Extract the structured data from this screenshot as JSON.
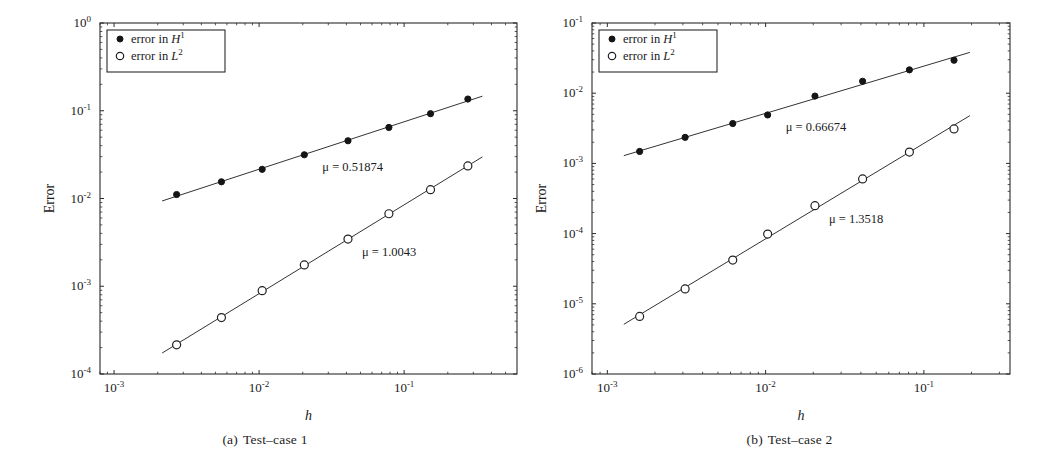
{
  "figure": {
    "panels": [
      {
        "id": "a",
        "caption_tag": "(a)",
        "caption_text": "Test–case 1",
        "xlabel": "h",
        "ylabel": "Error",
        "legend": [
          {
            "marker": "filled-dot",
            "label": "error in ",
            "math_base": "H",
            "math_exp": "1"
          },
          {
            "marker": "open-circle",
            "label": "error in ",
            "math_base": "L",
            "math_exp": "2"
          }
        ],
        "annotations": [
          {
            "name": "slope-h1",
            "text": "μ = 0.51874",
            "mu": 0.51874
          },
          {
            "name": "slope-l2",
            "text": "μ = 1.0043",
            "mu": 1.0043
          }
        ],
        "xticks": [
          {
            "base": "10",
            "exp": "-3",
            "value": 0.001
          },
          {
            "base": "10",
            "exp": "-2",
            "value": 0.01
          },
          {
            "base": "10",
            "exp": "-1",
            "value": 0.1
          }
        ],
        "yticks": [
          {
            "base": "10",
            "exp": "-4",
            "value": 0.0001
          },
          {
            "base": "10",
            "exp": "-3",
            "value": 0.001
          },
          {
            "base": "10",
            "exp": "-2",
            "value": 0.01
          },
          {
            "base": "10",
            "exp": "-1",
            "value": 0.1
          },
          {
            "base": "10",
            "exp": "0",
            "value": 1
          }
        ]
      },
      {
        "id": "b",
        "caption_tag": "(b)",
        "caption_text": "Test–case 2",
        "xlabel": "h",
        "ylabel": "Error",
        "legend": [
          {
            "marker": "filled-dot",
            "label": "error in ",
            "math_base": "H",
            "math_exp": "1"
          },
          {
            "marker": "open-circle",
            "label": "error in ",
            "math_base": "L",
            "math_exp": "2"
          }
        ],
        "annotations": [
          {
            "name": "slope-h1",
            "text": "μ = 0.66674",
            "mu": 0.66674
          },
          {
            "name": "slope-l2",
            "text": "μ = 1.3518",
            "mu": 1.3518
          }
        ],
        "xticks": [
          {
            "base": "10",
            "exp": "-3",
            "value": 0.001
          },
          {
            "base": "10",
            "exp": "-2",
            "value": 0.01
          },
          {
            "base": "10",
            "exp": "-1",
            "value": 0.1
          }
        ],
        "yticks": [
          {
            "base": "10",
            "exp": "-6",
            "value": 1e-06
          },
          {
            "base": "10",
            "exp": "-5",
            "value": 1e-05
          },
          {
            "base": "10",
            "exp": "-4",
            "value": 0.0001
          },
          {
            "base": "10",
            "exp": "-3",
            "value": 0.001
          },
          {
            "base": "10",
            "exp": "-2",
            "value": 0.01
          },
          {
            "base": "10",
            "exp": "-1",
            "value": 0.1
          }
        ]
      }
    ]
  },
  "chart_data": [
    {
      "type": "line",
      "panel": "a",
      "title": "(a) Test–case 1",
      "xlabel": "h",
      "ylabel": "Error",
      "xscale": "log",
      "yscale": "log",
      "xlim": [
        0.0008,
        0.6
      ],
      "ylim": [
        0.0001,
        1.0
      ],
      "grid": false,
      "legend_position": "top-left",
      "series": [
        {
          "name": "error in H^1",
          "marker": "filled-dot",
          "slope_label": "μ = 0.51874",
          "slope": 0.51874,
          "x": [
            0.0027,
            0.0055,
            0.0105,
            0.0205,
            0.041,
            0.0785,
            0.152,
            0.275
          ],
          "y": [
            0.0111,
            0.0155,
            0.0215,
            0.0315,
            0.0455,
            0.0645,
            0.0925,
            0.136
          ]
        },
        {
          "name": "error in L^2",
          "marker": "open-circle",
          "slope_label": "μ = 1.0043",
          "slope": 1.0043,
          "x": [
            0.0027,
            0.0055,
            0.0105,
            0.0205,
            0.041,
            0.0785,
            0.152,
            0.275
          ],
          "y": [
            0.000215,
            0.00044,
            0.00089,
            0.00175,
            0.00345,
            0.0067,
            0.0126,
            0.0235
          ]
        }
      ]
    },
    {
      "type": "line",
      "panel": "b",
      "title": "(b) Test–case 2",
      "xlabel": "h",
      "ylabel": "Error",
      "xscale": "log",
      "yscale": "log",
      "xlim": [
        0.0008,
        0.35
      ],
      "ylim": [
        1e-06,
        0.1
      ],
      "grid": false,
      "legend_position": "top-left",
      "series": [
        {
          "name": "error in H^1",
          "marker": "filled-dot",
          "slope_label": "μ = 0.66674",
          "slope": 0.66674,
          "x": [
            0.0016,
            0.0031,
            0.0062,
            0.0103,
            0.0205,
            0.041,
            0.081,
            0.155
          ],
          "y": [
            0.00148,
            0.00235,
            0.0037,
            0.0049,
            0.0091,
            0.0148,
            0.0215,
            0.0295
          ]
        },
        {
          "name": "error in L^2",
          "marker": "open-circle",
          "slope_label": "μ = 1.3518",
          "slope": 1.3518,
          "x": [
            0.0016,
            0.0031,
            0.0062,
            0.0103,
            0.0205,
            0.041,
            0.081,
            0.155
          ],
          "y": [
            6.6e-06,
            1.63e-05,
            4.2e-05,
            9.85e-05,
            0.00025,
            0.0006,
            0.00145,
            0.0031
          ]
        }
      ]
    }
  ]
}
